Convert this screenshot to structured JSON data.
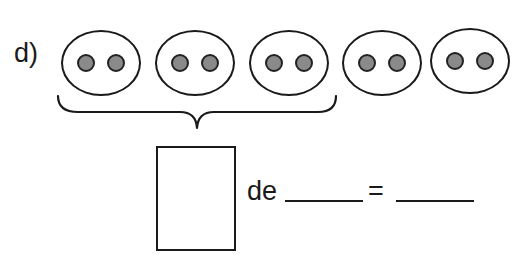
{
  "exercise": {
    "label": "d)",
    "groups": [
      {
        "dots": 2
      },
      {
        "dots": 2
      },
      {
        "dots": 2
      },
      {
        "dots": 2
      },
      {
        "dots": 2
      }
    ],
    "bracketed_groups": 3,
    "total_groups": 5,
    "dots_per_group": 2,
    "fraction_box_value": "",
    "connector_word": "de",
    "blank_1_value": "",
    "equals_sign": "=",
    "blank_2_value": ""
  },
  "colors": {
    "stroke": "#1a1a1a",
    "dot_fill": "#8a8a8a",
    "background": "#ffffff"
  }
}
